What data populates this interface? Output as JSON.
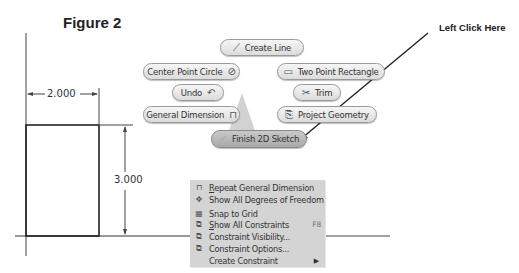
{
  "figure": {
    "title": "Figure 2"
  },
  "callout": {
    "label": "Left Click Here"
  },
  "drawing": {
    "horizontal_dimension": "2.000",
    "vertical_dimension": "3.000"
  },
  "marking_menu": {
    "buttons": [
      {
        "id": "create-line",
        "label": "Create Line",
        "icon": "line-icon"
      },
      {
        "id": "center-point-circle",
        "label": "Center Point Circle",
        "icon": "circle-icon"
      },
      {
        "id": "two-point-rectangle",
        "label": "Two Point Rectangle",
        "icon": "rectangle-icon"
      },
      {
        "id": "undo",
        "label": "Undo",
        "icon": "undo-icon"
      },
      {
        "id": "trim",
        "label": "Trim",
        "icon": "trim-icon"
      },
      {
        "id": "general-dimension",
        "label": "General Dimension",
        "icon": "dimension-icon"
      },
      {
        "id": "project-geometry",
        "label": "Project Geometry",
        "icon": "project-geometry-icon"
      },
      {
        "id": "finish-2d-sketch",
        "label": "Finish 2D Sketch",
        "icon": "checkmark-icon"
      }
    ]
  },
  "context_menu": {
    "items": [
      {
        "label_ul": "R",
        "label_rest": "epeat General Dimension",
        "icon": "dimension-icon",
        "shortcut": ""
      },
      {
        "label_ul": "",
        "label_rest": "Show All Degrees of Freedom",
        "icon": "degrees-of-freedom-icon",
        "shortcut": ""
      },
      {
        "label_ul": "",
        "label_rest": "Snap to Grid",
        "icon": "snap-grid-icon",
        "shortcut": ""
      },
      {
        "label_ul": "S",
        "label_rest": "how All Constraints",
        "icon": "show-constraints-icon",
        "shortcut": "F8"
      },
      {
        "label_ul": "",
        "label_rest": "Constraint Visibility...",
        "icon": "constraint-visibility-icon",
        "shortcut": ""
      },
      {
        "label_ul": "",
        "label_rest": "Constraint Options...",
        "icon": "constraint-options-icon",
        "shortcut": ""
      },
      {
        "label_ul": "",
        "label_rest": "Create Constraint",
        "icon": "",
        "shortcut": "",
        "submenu": "▶"
      }
    ]
  },
  "colors": {
    "menu_bg": "#d4d4d4",
    "button_bg": "#e8e8e8",
    "finish_button_bg": "#b8b8b8",
    "line": "#222222"
  }
}
